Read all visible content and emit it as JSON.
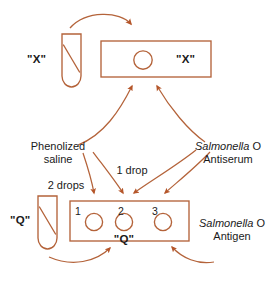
{
  "diagram": {
    "colors": {
      "stroke": "#b4633a",
      "arrow_fill": "#b5562a",
      "text": "#1a1a1a",
      "background": "#ffffff"
    },
    "top_row": {
      "tube_label": "\"X\"",
      "slide_label": "\"X\"",
      "slide_wells": [
        ""
      ]
    },
    "bottom_row": {
      "tube_label": "\"Q\"",
      "slide_label": "\"Q\"",
      "well_numbers": [
        "1",
        "2",
        "3"
      ]
    },
    "reagents": {
      "phenolized_saline": {
        "line1": "Phenolized",
        "line2": "saline"
      },
      "antiserum": {
        "genus": "Salmonella",
        "rest": " O",
        "line2": "Antiserum"
      },
      "antigen": {
        "genus": "Salmonella",
        "rest": " O",
        "line2": "Antigen"
      }
    },
    "volumes": {
      "one_drop": "1 drop",
      "two_drops": "2 drops"
    }
  }
}
